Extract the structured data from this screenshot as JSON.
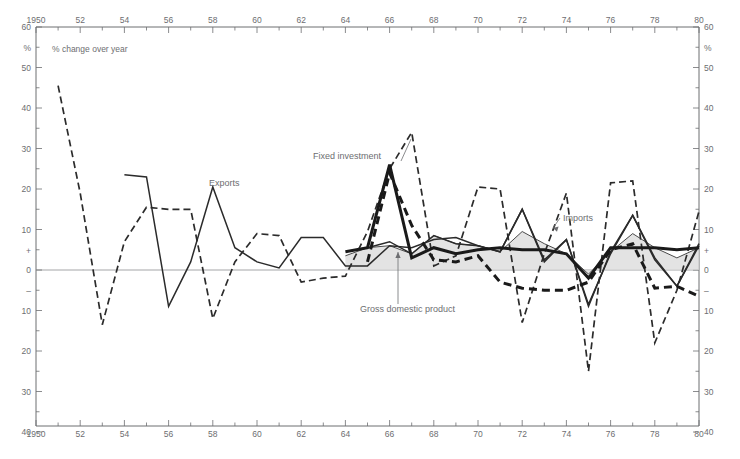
{
  "figure": {
    "note": "% change over year",
    "axis_unit_symbol": "%",
    "plus_symbol": "+",
    "minus_symbol": "–"
  },
  "axes": {
    "y_ticks_top": [
      "60",
      "50",
      "40",
      "30",
      "20",
      "10"
    ],
    "y_ticks_bottom": [
      "10",
      "20",
      "30",
      "40"
    ],
    "y_zero": "0",
    "x_ticks": [
      "1950",
      "52",
      "54",
      "56",
      "58",
      "60",
      "62",
      "64",
      "66",
      "68",
      "70",
      "72",
      "74",
      "76",
      "78",
      "80"
    ],
    "x_first_label": "1950",
    "x_last_label": "80",
    "y_top_label": "60",
    "y_bottom_label": "40"
  },
  "series_labels": {
    "exports": "Exports",
    "imports": "Imports",
    "fixed_investment": "Fixed investment",
    "gdp": "Gross domestic product"
  },
  "chart_data": {
    "type": "line",
    "title": "",
    "subtitle": "% change over year",
    "xlabel": "",
    "ylabel": "% change over year",
    "xlim": [
      1950,
      1980
    ],
    "ylim": [
      -40,
      60
    ],
    "grid": false,
    "legend": "inline-annotations",
    "x": [
      1950,
      1951,
      1952,
      1953,
      1954,
      1955,
      1956,
      1957,
      1958,
      1959,
      1960,
      1961,
      1962,
      1963,
      1964,
      1965,
      1966,
      1967,
      1968,
      1969,
      1970,
      1971,
      1972,
      1973,
      1974,
      1975,
      1976,
      1977,
      1978,
      1979,
      1980
    ],
    "series": [
      {
        "name": "Exports",
        "style": "thin-solid",
        "color": "#2b2b2b",
        "values": [
          null,
          null,
          null,
          null,
          23.5,
          23.0,
          -9.0,
          2.0,
          20.5,
          5.5,
          2.0,
          0.5,
          8.0,
          8.0,
          1.0,
          1.0,
          6.0,
          5.5,
          7.5,
          8.0,
          6.0,
          4.5,
          15.0,
          2.0,
          7.5,
          -8.5,
          4.0,
          13.5,
          2.5,
          -4.0,
          6.0
        ]
      },
      {
        "name": "Imports",
        "style": "thin-solid-right",
        "color": "#2b2b2b",
        "values": [
          null,
          null,
          null,
          null,
          null,
          null,
          null,
          null,
          null,
          null,
          null,
          null,
          null,
          null,
          null,
          5.5,
          7.0,
          4.0,
          8.5,
          6.5,
          6.0,
          4.5,
          15.0,
          2.5,
          7.5,
          -9.0,
          4.5,
          13.5,
          3.0,
          -4.0,
          6.5
        ]
      },
      {
        "name": "Fixed investment",
        "style": "thick-solid",
        "color": "#1a1a1a",
        "values": [
          null,
          null,
          null,
          null,
          null,
          null,
          null,
          null,
          null,
          null,
          null,
          null,
          null,
          null,
          4.5,
          5.5,
          26.0,
          3.0,
          5.5,
          4.0,
          5.0,
          5.5,
          5.0,
          5.0,
          4.0,
          -2.0,
          5.5,
          5.5,
          5.5,
          5.0,
          5.5
        ]
      },
      {
        "name": "Exports (dashed)",
        "style": "thin-dashed",
        "color": "#2b2b2b",
        "values": [
          null,
          45.5,
          19.0,
          -13.5,
          7.0,
          15.5,
          15.0,
          15.0,
          -12.0,
          2.0,
          9.0,
          8.5,
          -3.0,
          -2.0,
          -1.5,
          9.5,
          25.0,
          34.0,
          1.0,
          3.5,
          20.5,
          20.0,
          -13.0,
          4.0,
          19.0,
          -25.0,
          21.5,
          22.0,
          -18.0,
          -5.0,
          14.5
        ]
      },
      {
        "name": "Fixed investment (dashed)",
        "style": "thick-dashed",
        "color": "#1a1a1a",
        "values": [
          null,
          null,
          null,
          null,
          null,
          null,
          null,
          null,
          null,
          null,
          null,
          null,
          null,
          null,
          null,
          2.0,
          24.0,
          11.0,
          2.5,
          2.0,
          3.5,
          -3.0,
          -4.5,
          -5.0,
          -5.0,
          -3.0,
          5.0,
          6.5,
          -4.5,
          -4.0,
          -6.5
        ]
      },
      {
        "name": "Gross domestic product",
        "style": "shaded-band",
        "color": "#d9d9d9",
        "values": [
          null,
          null,
          null,
          null,
          null,
          null,
          null,
          null,
          null,
          null,
          null,
          null,
          null,
          null,
          3.5,
          5.5,
          6.0,
          4.0,
          8.5,
          6.5,
          6.0,
          4.5,
          9.5,
          6.5,
          4.0,
          -1.0,
          4.5,
          9.0,
          5.5,
          3.0,
          5.5
        ]
      }
    ],
    "annotations": [
      {
        "text": "Exports",
        "x": 1958.5,
        "y": 23
      },
      {
        "text": "Fixed investment",
        "x": 1965.0,
        "y": 30
      },
      {
        "text": "Imports",
        "x": 1974.0,
        "y": 12
      },
      {
        "text": "Gross domestic product",
        "x": 1966.4,
        "y": -10
      }
    ]
  }
}
